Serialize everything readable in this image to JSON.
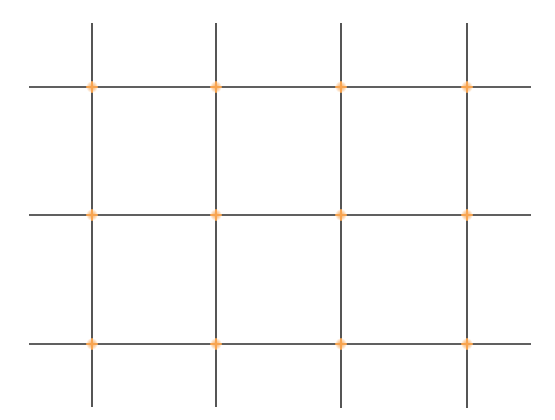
{
  "diagram": {
    "type": "rule-of-thirds-grid",
    "width": 555,
    "height": 420,
    "colors": {
      "background": "#ffffff",
      "line": "#2b2b2b",
      "marker": "#f7a450"
    },
    "line_width": 1.6,
    "vertical_lines": [
      {
        "x": 92,
        "y1": 23,
        "y2": 407
      },
      {
        "x": 216,
        "y1": 23,
        "y2": 407
      },
      {
        "x": 341,
        "y1": 23,
        "y2": 408
      },
      {
        "x": 467,
        "y1": 23,
        "y2": 408
      }
    ],
    "horizontal_lines": [
      {
        "y": 87,
        "x1": 29,
        "x2": 531
      },
      {
        "y": 215,
        "x1": 29,
        "x2": 531
      },
      {
        "y": 344,
        "x1": 29,
        "x2": 531
      }
    ],
    "markers": [
      {
        "x": 92,
        "y": 87
      },
      {
        "x": 216,
        "y": 87
      },
      {
        "x": 341,
        "y": 87
      },
      {
        "x": 467,
        "y": 87
      },
      {
        "x": 92,
        "y": 215
      },
      {
        "x": 216,
        "y": 215
      },
      {
        "x": 341,
        "y": 215
      },
      {
        "x": 467,
        "y": 215
      },
      {
        "x": 92,
        "y": 344
      },
      {
        "x": 216,
        "y": 344
      },
      {
        "x": 341,
        "y": 344
      },
      {
        "x": 467,
        "y": 344
      }
    ],
    "marker_size": 10
  }
}
